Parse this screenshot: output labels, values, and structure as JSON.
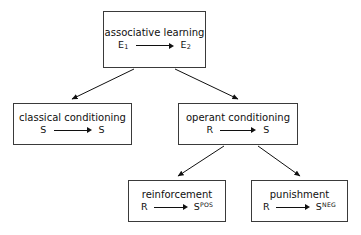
{
  "diagram": {
    "background_color": "#ffffff",
    "border_color": "#3a3a3a",
    "text_color": "#101010",
    "nodes": [
      {
        "id": "associative-learning",
        "label": "associative learning",
        "relation": {
          "left": "E",
          "left_sub": "1",
          "right": "E",
          "right_sub": "2"
        }
      },
      {
        "id": "classical-conditioning",
        "label": "classical conditioning",
        "relation": {
          "left": "S",
          "right": "S"
        }
      },
      {
        "id": "operant-conditioning",
        "label": "operant conditioning",
        "relation": {
          "left": "R",
          "right": "S"
        }
      },
      {
        "id": "reinforcement",
        "label": "reinforcement",
        "relation": {
          "left": "R",
          "right": "S",
          "right_sup": "POS"
        }
      },
      {
        "id": "punishment",
        "label": "punishment",
        "relation": {
          "left": "R",
          "right": "S",
          "right_sup": "NEG"
        }
      }
    ]
  }
}
